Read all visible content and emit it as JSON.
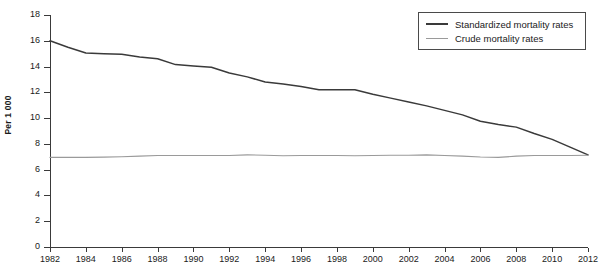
{
  "axis": {
    "y_title": "Per 1 000",
    "y_ticks": [
      0,
      2,
      4,
      6,
      8,
      10,
      12,
      14,
      16,
      18
    ],
    "x_ticks": [
      1982,
      1984,
      1986,
      1988,
      1990,
      1992,
      1994,
      1996,
      1998,
      2000,
      2002,
      2004,
      2006,
      2008,
      2010,
      2012
    ]
  },
  "legend": {
    "items": [
      {
        "label": "Standardized mortality rates",
        "color": "#3a3a3a"
      },
      {
        "label": "Crude mortality rates",
        "color": "#9a9a9a"
      }
    ]
  },
  "title_remnant": "",
  "chart_data": {
    "type": "line",
    "title": "",
    "xlabel": "",
    "ylabel": "Per 1 000",
    "xlim": [
      1982,
      2012
    ],
    "ylim": [
      0,
      18
    ],
    "yticks": [
      0,
      2,
      4,
      6,
      8,
      10,
      12,
      14,
      16,
      18
    ],
    "xticks": [
      1982,
      1984,
      1986,
      1988,
      1990,
      1992,
      1994,
      1996,
      1998,
      2000,
      2002,
      2004,
      2006,
      2008,
      2010,
      2012
    ],
    "grid": false,
    "legend_position": "top-right",
    "x": [
      1982,
      1983,
      1984,
      1985,
      1986,
      1987,
      1988,
      1989,
      1990,
      1991,
      1992,
      1993,
      1994,
      1995,
      1996,
      1997,
      1998,
      1999,
      2000,
      2001,
      2002,
      2003,
      2004,
      2005,
      2006,
      2007,
      2008,
      2009,
      2010,
      2011,
      2012
    ],
    "series": [
      {
        "name": "Standardized mortality rates",
        "color": "#3a3a3a",
        "values": [
          16.0,
          15.5,
          15.05,
          15.0,
          14.95,
          14.75,
          14.6,
          14.15,
          14.05,
          13.95,
          13.5,
          13.2,
          12.8,
          12.65,
          12.45,
          12.2,
          12.2,
          12.2,
          11.85,
          11.55,
          11.25,
          10.95,
          10.6,
          10.25,
          9.75,
          9.5,
          9.3,
          8.8,
          8.35,
          7.75,
          7.15
        ]
      },
      {
        "name": "Crude mortality rates",
        "color": "#9a9a9a",
        "values": [
          6.95,
          6.95,
          6.95,
          6.97,
          7.0,
          7.05,
          7.1,
          7.1,
          7.1,
          7.1,
          7.1,
          7.15,
          7.12,
          7.08,
          7.1,
          7.1,
          7.1,
          7.08,
          7.1,
          7.12,
          7.12,
          7.15,
          7.1,
          7.05,
          6.98,
          6.95,
          7.05,
          7.1,
          7.1,
          7.1,
          7.12
        ]
      }
    ]
  }
}
